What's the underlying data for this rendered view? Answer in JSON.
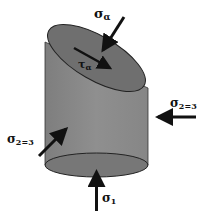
{
  "diagram": {
    "labels": {
      "sigma_alpha": {
        "symbol": "σ",
        "sub": "α"
      },
      "tau_alpha": {
        "symbol": "τ",
        "sub": "α"
      },
      "sigma_23_right": {
        "symbol": "σ",
        "sub": "2=3"
      },
      "sigma_23_left": {
        "symbol": "σ",
        "sub": "2=3"
      },
      "sigma_1": {
        "symbol": "σ",
        "sub": "1"
      }
    },
    "colors": {
      "cylinder_body": "#8a8a8a",
      "top_face": "#6f6f6f",
      "bottom_face": "#777777",
      "outline": "#222222",
      "arrow": "#111111",
      "background": "#ffffff"
    }
  }
}
